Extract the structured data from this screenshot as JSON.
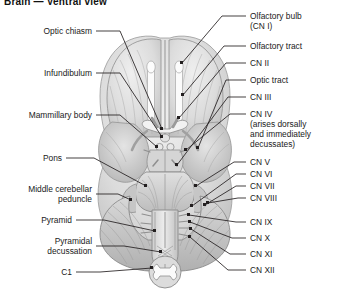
{
  "header": {
    "title": "Brain — Ventral view"
  },
  "figure": {
    "name": "ventral-view-of-brain-illustration",
    "background": "#ffffff",
    "ink": "#231f20",
    "tissue_light": "#e6e6e6",
    "tissue_mid": "#c9c9c9",
    "tissue_dark": "#a8a8a8",
    "tract_white": "#fbfbfb"
  },
  "labels_left": [
    {
      "id": "optic-chiasm",
      "text": "Optic chiasm"
    },
    {
      "id": "infundibulum",
      "text": "Infundibulum"
    },
    {
      "id": "mammillary-body",
      "text": "Mammillary body"
    },
    {
      "id": "pons",
      "text": "Pons"
    },
    {
      "id": "middle-cerebellar-peduncle",
      "text": "Middle cerebellar",
      "text2": "peduncle"
    },
    {
      "id": "pyramid",
      "text": "Pyramid"
    },
    {
      "id": "pyramidal-decussation",
      "text": "Pyramidal",
      "text2": "decussation"
    },
    {
      "id": "c1",
      "text": "C1"
    }
  ],
  "labels_right": [
    {
      "id": "olfactory-bulb",
      "text": "Olfactory bulb",
      "text2": "(CN I)"
    },
    {
      "id": "olfactory-tract",
      "text": "Olfactory tract"
    },
    {
      "id": "cn-2",
      "text": "CN II"
    },
    {
      "id": "optic-tract",
      "text": "Optic tract"
    },
    {
      "id": "cn-3",
      "text": "CN III"
    },
    {
      "id": "cn-4",
      "text": "CN IV",
      "text2": "(arises dorsally",
      "text3": "and immediately",
      "text4": "decussates)"
    },
    {
      "id": "cn-5",
      "text": "CN V"
    },
    {
      "id": "cn-6",
      "text": "CN VI"
    },
    {
      "id": "cn-7",
      "text": "CN VII"
    },
    {
      "id": "cn-8",
      "text": "CN VIII"
    },
    {
      "id": "cn-9",
      "text": "CN IX"
    },
    {
      "id": "cn-10",
      "text": "CN X"
    },
    {
      "id": "cn-11",
      "text": "CN XI"
    },
    {
      "id": "cn-12",
      "text": "CN XII"
    }
  ]
}
